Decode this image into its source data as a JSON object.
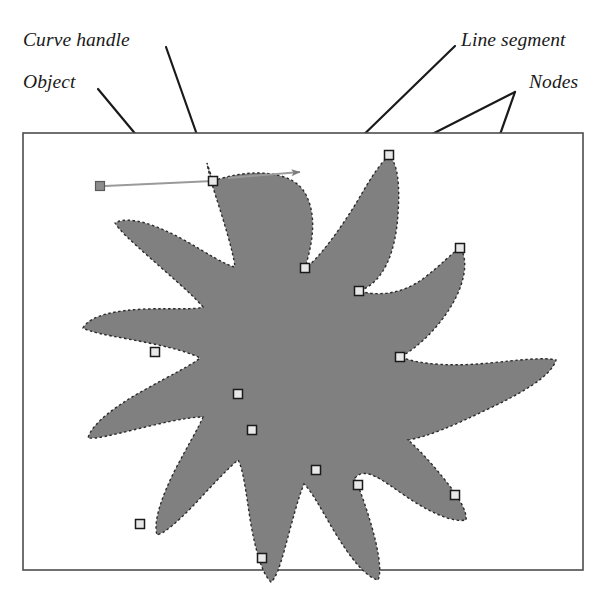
{
  "figure": {
    "width": 607,
    "height": 597,
    "background_color": "#ffffff"
  },
  "labels": {
    "curve_handle": "Curve handle",
    "object": "Object",
    "line_segment": "Line segment",
    "nodes": "Nodes"
  },
  "colors": {
    "object_fill": "#808080",
    "object_outline": "#262626",
    "frame_border": "#4d4d4d",
    "leader_line": "#1a1a1a",
    "node_fill": "#e8e8e8",
    "node_stroke": "#1a1a1a",
    "handle_line": "#9a9a9a",
    "text": "#1a1a1a"
  },
  "canvas_frame": {
    "x": 23,
    "y": 133,
    "width": 560,
    "height": 437,
    "border_width": 1.5
  },
  "leader_lines": [
    {
      "name": "curve-handle-leader",
      "x1": 166,
      "y1": 47,
      "x2": 214,
      "y2": 183
    },
    {
      "name": "object-leader",
      "x1": 98,
      "y1": 89,
      "x2": 301,
      "y2": 333
    },
    {
      "name": "line-segment-leader",
      "x1": 455,
      "y1": 46,
      "x2": 280,
      "y2": 216
    },
    {
      "name": "nodes-leader-upper",
      "x1": 515,
      "y1": 92,
      "x2": 389,
      "y2": 156
    },
    {
      "name": "nodes-leader-lower",
      "x1": 515,
      "y1": 92,
      "x2": 460,
      "y2": 248
    }
  ],
  "curve_handle": {
    "square": {
      "x": 100,
      "y": 186,
      "size": 9
    },
    "segment_a": {
      "x1": 105,
      "y1": 186,
      "x2": 213,
      "y2": 181
    },
    "segment_b": {
      "x1": 228,
      "y1": 178,
      "x2": 305,
      "y2": 172
    },
    "arrow_tip": {
      "x": 308,
      "y": 172
    }
  },
  "nodes": [
    {
      "x": 213,
      "y": 181
    },
    {
      "x": 389,
      "y": 156
    },
    {
      "x": 305,
      "y": 268
    },
    {
      "x": 460,
      "y": 248
    },
    {
      "x": 359,
      "y": 291
    },
    {
      "x": 400,
      "y": 357
    },
    {
      "x": 155,
      "y": 352
    },
    {
      "x": 238,
      "y": 394
    },
    {
      "x": 252,
      "y": 430
    },
    {
      "x": 355,
      "y": 478
    },
    {
      "x": 316,
      "y": 470
    },
    {
      "x": 358,
      "y": 485
    },
    {
      "x": 455,
      "y": 495
    },
    {
      "x": 140,
      "y": 524
    },
    {
      "x": 262,
      "y": 558
    }
  ],
  "object_shape": {
    "description": "Irregular star/splat silhouette with twelve radiating lobes",
    "fill": "#808080",
    "lobe_count": 12
  }
}
